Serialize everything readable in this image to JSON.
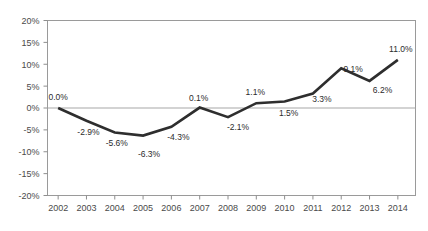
{
  "chart_data": {
    "type": "line",
    "title": "",
    "subtitle": "",
    "xlabel": "",
    "ylabel": "",
    "categories": [
      "2002",
      "2003",
      "2004",
      "2005",
      "2006",
      "2007",
      "2008",
      "2009",
      "2010",
      "2011",
      "2012",
      "2013",
      "2014"
    ],
    "values": [
      0.0,
      -2.9,
      -5.6,
      -6.3,
      -4.3,
      0.1,
      -2.1,
      1.1,
      1.5,
      3.3,
      9.1,
      6.2,
      11.0
    ],
    "point_labels": [
      "0.0%",
      "-2.9%",
      "-5.6%",
      "-6.3%",
      "-4.3%",
      "0.1%",
      "-2.1%",
      "1.1%",
      "1.5%",
      "3.3%",
      "9.1%",
      "6.2%",
      "11.0%"
    ],
    "series": [
      {
        "name": "",
        "values": [
          0.0,
          -2.9,
          -5.6,
          -6.3,
          -4.3,
          0.1,
          -2.1,
          1.1,
          1.5,
          3.3,
          9.1,
          6.2,
          11.0
        ]
      }
    ],
    "ylim": [
      -20,
      20
    ],
    "ytick_values": [
      20,
      15,
      10,
      5,
      0,
      -5,
      -10,
      -15,
      -20
    ],
    "ytick_labels": [
      "20%",
      "15%",
      "10%",
      "5%",
      "0%",
      "-5%",
      "-10%",
      "-15%",
      "-20%"
    ],
    "xtick_labels": [
      "2002",
      "2003",
      "2004",
      "2005",
      "2006",
      "2007",
      "2008",
      "2009",
      "2010",
      "2011",
      "2012",
      "2013",
      "2014"
    ],
    "grid": false,
    "zero_line": true,
    "legend": "none",
    "colors": {
      "line": "#2e2e2e",
      "frame": "#9a9a9a",
      "zero_line": "#a8a8a8",
      "text": "#4a4a4a",
      "label_text": "#2b2b2b",
      "background": "#ffffff"
    },
    "label_offsets": [
      {
        "dx": 0,
        "dy": -8
      },
      {
        "dx": 2,
        "dy": 14
      },
      {
        "dx": 2,
        "dy": 13
      },
      {
        "dx": 6,
        "dy": 21
      },
      {
        "dx": 7,
        "dy": 13
      },
      {
        "dx": -1,
        "dy": -7
      },
      {
        "dx": 10,
        "dy": 13
      },
      {
        "dx": -1,
        "dy": -8
      },
      {
        "dx": 4,
        "dy": 15
      },
      {
        "dx": 9,
        "dy": 8
      },
      {
        "dx": 12,
        "dy": 4
      },
      {
        "dx": 13,
        "dy": 12
      },
      {
        "dx": 3,
        "dy": -8
      }
    ]
  }
}
